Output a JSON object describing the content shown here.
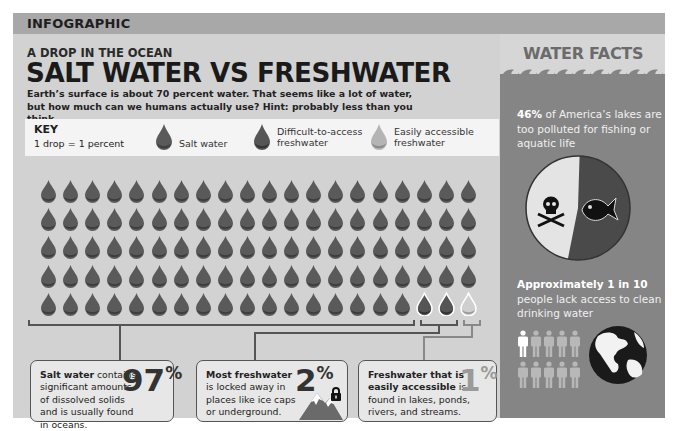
{
  "header": {
    "section_label": "INFOGRAPHIC",
    "kicker": "A DROP IN THE OCEAN",
    "title": "SALT WATER VS FRESHWATER",
    "subtitle": "Earth’s surface is about 70 percent water. That seems like a lot of water, but how much can we humans actually use? Hint: probably less than you think."
  },
  "key": {
    "title": "KEY",
    "subtitle": "1 drop = 1 percent",
    "items": [
      {
        "label": "Salt water",
        "icon": "salt-water-drop-icon"
      },
      {
        "label_line1": "Difficult-to-access",
        "label_line2": "freshwater",
        "icon": "difficult-freshwater-drop-icon"
      },
      {
        "label_line1": "Easily accessible",
        "label_line2": "freshwater",
        "icon": "accessible-freshwater-drop-icon"
      }
    ]
  },
  "grid": {
    "columns": 20,
    "rows": 5,
    "total_drops": 100,
    "salt_water_drops": 97,
    "difficult_freshwater_drops": 2,
    "accessible_freshwater_drops": 1
  },
  "cards": [
    {
      "bold": "Salt water",
      "rest": " contains significant amounts of dissolved solids and is usually found in oceans.",
      "number": "97",
      "unit": "%"
    },
    {
      "bold": "Most freshwater",
      "rest": " is locked away in places like ice caps or underground.",
      "number": "2",
      "unit": "%",
      "icons": [
        "mountain-icon",
        "lock-icon"
      ]
    },
    {
      "bold": "Freshwater that is easily accessible",
      "rest": " is found in lakes, ponds, rivers, and streams.",
      "number": "1",
      "unit": "%"
    }
  ],
  "sidebar": {
    "title": "WATER FACTS",
    "fact1": {
      "bold": "46%",
      "rest": " of America’s lakes are too polluted for fishing or aquatic life",
      "pie_polluted_percent": 46
    },
    "fact2": {
      "bold": "Approximately 1 in 10",
      "rest": " people lack access to clean drinking water",
      "people_total": 10,
      "people_highlighted": 1
    }
  },
  "colors": {
    "frame_bg": "#d2d2d2",
    "topbar_bg": "#a8a8a8",
    "sidebar_bg": "#858585",
    "salt_drop": "#5a5a5a",
    "difficult_drop": "#555555",
    "accessible_drop": "#9a9a9a"
  }
}
